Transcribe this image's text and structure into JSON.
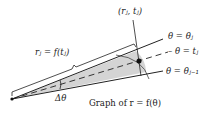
{
  "diagram": {
    "labels": {
      "point": "(rⱼ, tⱼ)",
      "radius": "rⱼ = f(tⱼ)",
      "theta_j": "θ = θⱼ",
      "theta_t": "– θ = tⱼ",
      "theta_j_minus_1": "θ = θⱼ₋₁",
      "delta_theta": "Δθ",
      "graph": "Graph of r = f(θ)"
    },
    "colors": {
      "sector_fill": "#d4d4d4",
      "line": "#222222"
    }
  }
}
